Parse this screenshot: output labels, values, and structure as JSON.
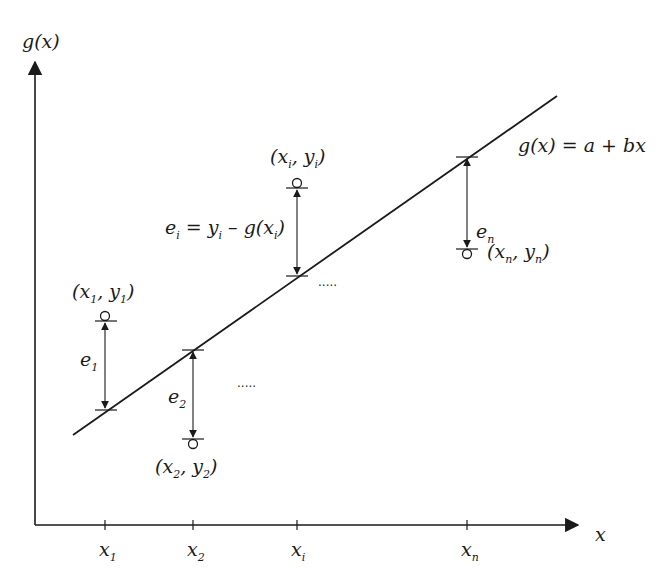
{
  "diagram": {
    "colors": {
      "ink": "#1a1a1a",
      "background": "#ffffff"
    },
    "axes": {
      "y_label": "g(x)",
      "x_label": "x",
      "x_ticks": [
        {
          "base": "x",
          "sub": "1"
        },
        {
          "base": "x",
          "sub": "2"
        },
        {
          "base": "x",
          "sub": "i"
        },
        {
          "base": "x",
          "sub": "n"
        }
      ]
    },
    "line_label": "g(x) = a + bx",
    "points": [
      {
        "label_base_x": "x",
        "label_sub_x": "1",
        "label_base_y": "y",
        "label_sub_y": "1",
        "residual": "e",
        "residual_sub": "1",
        "position": "above"
      },
      {
        "label_base_x": "x",
        "label_sub_x": "2",
        "label_base_y": "y",
        "label_sub_y": "2",
        "residual": "e",
        "residual_sub": "2",
        "position": "below"
      },
      {
        "label_base_x": "x",
        "label_sub_x": "i",
        "label_base_y": "y",
        "label_sub_y": "i",
        "residual": "e",
        "residual_sub": "i",
        "position": "above"
      },
      {
        "label_base_x": "x",
        "label_sub_x": "n",
        "label_base_y": "y",
        "label_sub_y": "n",
        "residual": "e",
        "residual_sub": "n",
        "position": "below"
      }
    ],
    "residual_formula": {
      "e": "e",
      "e_sub": "i",
      "eq": "=",
      "y": "y",
      "y_sub": "i",
      "minus": "–",
      "g": "g(x",
      "g_sub": "i",
      "close": ")"
    },
    "ellipsis": "....."
  }
}
